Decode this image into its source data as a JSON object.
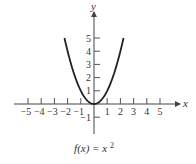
{
  "chart_data": {
    "type": "line",
    "title": "",
    "caption": "f(x) = x²",
    "function": "f(x) = x^2",
    "xlabel": "x",
    "ylabel": "y",
    "xlim": [
      -6,
      6.5
    ],
    "ylim": [
      -2.2,
      7
    ],
    "grid": false,
    "legend": null,
    "x_ticks": [
      -5,
      -4,
      -3,
      -2,
      -1,
      1,
      2,
      3,
      4,
      5
    ],
    "x_tick_labels": [
      "−5",
      "−4",
      "−3",
      "−2",
      "−1",
      "1",
      "2",
      "3",
      "4",
      "5"
    ],
    "y_ticks": [
      -1,
      1,
      2,
      3,
      4,
      5
    ],
    "y_tick_labels": [
      "−1",
      "1",
      "2",
      "3",
      "4",
      "5"
    ],
    "series": [
      {
        "name": "f(x) = x^2",
        "x": [
          -2.236,
          -2,
          -1.5,
          -1,
          -0.5,
          0,
          0.5,
          1,
          1.5,
          2,
          2.236
        ],
        "y": [
          5,
          4,
          2.25,
          1,
          0.25,
          0,
          0.25,
          1,
          2.25,
          4,
          5
        ]
      }
    ]
  },
  "labels": {
    "x_axis": "x",
    "y_axis": "y",
    "caption_fx": "f(x) = x",
    "caption_exp": "2"
  },
  "colors": {
    "curve": "#222222",
    "axes": "#444444",
    "background": "#ffffff"
  }
}
